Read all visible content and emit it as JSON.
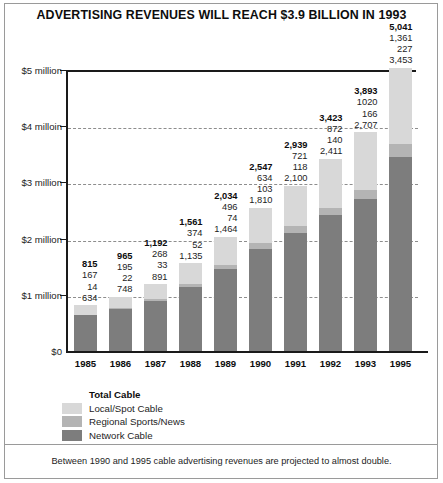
{
  "title": "ADVERTISING REVENUES WILL REACH $3.9 BILLION IN 1993",
  "footnote": "Between 1990 and 1995 cable advertising revenues are projected to almost double.",
  "y_axis": {
    "ticks": [
      {
        "value": 0,
        "label": "$0"
      },
      {
        "value": 1000,
        "label": "$1 million"
      },
      {
        "value": 2000,
        "label": "$2 million"
      },
      {
        "value": 3000,
        "label": "$3 million"
      },
      {
        "value": 4000,
        "label": "$4 milloin"
      },
      {
        "value": 5000,
        "label": "$5 million"
      }
    ]
  },
  "legend": {
    "heading": "Total Cable",
    "items": [
      {
        "label": "Local/Spot Cable",
        "color": "#d8d8d8"
      },
      {
        "label": "Regional Sports/News",
        "color": "#b4b4b4"
      },
      {
        "label": "Network Cable",
        "color": "#7d7d7d"
      }
    ]
  },
  "chart_data": {
    "type": "bar",
    "subtype": "stacked",
    "title": "ADVERTISING REVENUES WILL REACH $3.9 BILLION IN 1993",
    "xlabel": "",
    "ylabel": "",
    "ylim": [
      0,
      5000
    ],
    "grid": true,
    "legend_position": "below-left",
    "units": "$ thousands",
    "categories": [
      "1985",
      "1986",
      "1987",
      "1988",
      "1989",
      "1990",
      "1991",
      "1992",
      "1993",
      "1995"
    ],
    "series": [
      {
        "name": "Local/Spot Cable",
        "color": "#d8d8d8",
        "values": [
          167,
          195,
          268,
          374,
          496,
          634,
          721,
          872,
          1020,
          1361
        ]
      },
      {
        "name": "Regional Sports/News",
        "color": "#b4b4b4",
        "values": [
          14,
          22,
          33,
          52,
          74,
          103,
          118,
          140,
          166,
          227
        ]
      },
      {
        "name": "Network Cable",
        "color": "#7d7d7d",
        "values": [
          634,
          748,
          891,
          1135,
          1464,
          1810,
          2100,
          2411,
          2707,
          3453
        ]
      }
    ],
    "totals": [
      815,
      965,
      1192,
      1561,
      2034,
      2547,
      2939,
      3423,
      3893,
      5041
    ],
    "point_labels": [
      {
        "category": "1985",
        "total": "815",
        "local": "167",
        "regional": "14",
        "network": "634"
      },
      {
        "category": "1986",
        "total": "965",
        "local": "195",
        "regional": "22",
        "network": "748"
      },
      {
        "category": "1987",
        "total": "1,192",
        "local": "268",
        "regional": "33",
        "network": "891"
      },
      {
        "category": "1988",
        "total": "1,561",
        "local": "374",
        "regional": "52",
        "network": "1,135"
      },
      {
        "category": "1989",
        "total": "2,034",
        "local": "496",
        "regional": "74",
        "network": "1,464"
      },
      {
        "category": "1990",
        "total": "2,547",
        "local": "634",
        "regional": "103",
        "network": "1,810"
      },
      {
        "category": "1991",
        "total": "2,939",
        "local": "721",
        "regional": "118",
        "network": "2,100"
      },
      {
        "category": "1992",
        "total": "3,423",
        "local": "872",
        "regional": "140",
        "network": "2,411"
      },
      {
        "category": "1993",
        "total": "3,893",
        "local": "1020",
        "regional": "166",
        "network": "2,707"
      },
      {
        "category": "1995",
        "total": "5,041",
        "local": "1,361",
        "regional": "227",
        "network": "3,453"
      }
    ]
  }
}
